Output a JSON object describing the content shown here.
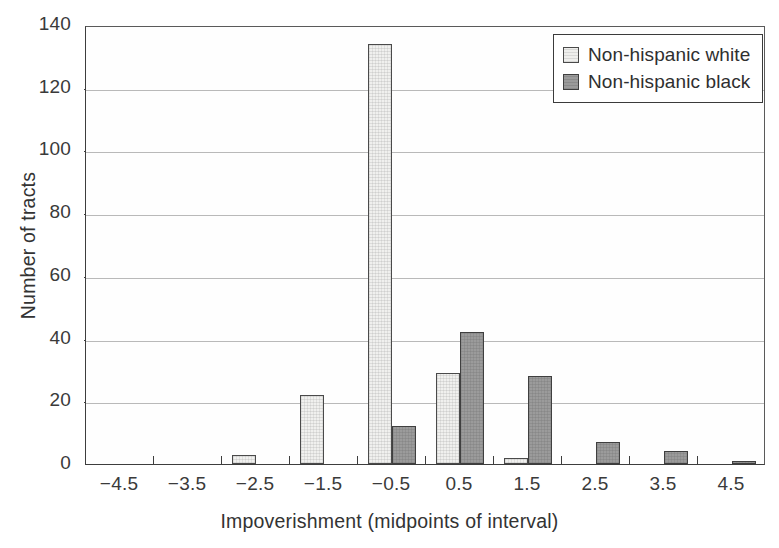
{
  "chart_data": {
    "type": "bar",
    "title": "",
    "subtitle": "",
    "xlabel": "Impoverishment (midpoints of interval)",
    "ylabel": "Number of tracts",
    "categories": [
      "-4.5",
      "-3.5",
      "-2.5",
      "-1.5",
      "-0.5",
      "0.5",
      "1.5",
      "2.5",
      "3.5",
      "4.5"
    ],
    "series": [
      {
        "name": "Non-hispanic white",
        "color": "#f0f0ee",
        "values": [
          0,
          0,
          3,
          22,
          134,
          29,
          2,
          0,
          0,
          0
        ]
      },
      {
        "name": "Non-hispanic black",
        "color": "#9b9b9b",
        "values": [
          0,
          0,
          0,
          0,
          12,
          42,
          28,
          7,
          4,
          1
        ]
      }
    ],
    "xlim": [
      -5,
      5
    ],
    "ylim": [
      0,
      140
    ],
    "ytick_values": [
      0,
      20,
      40,
      60,
      80,
      100,
      120,
      140
    ],
    "ytick_labels": [
      "0",
      "20",
      "40",
      "60",
      "80",
      "100",
      "120",
      "140"
    ],
    "grid": true,
    "grid_axis": "y",
    "legend_position": "top-right"
  },
  "legend": {
    "entries": [
      {
        "label": "Non-hispanic white",
        "swatch": "light-square-swatch"
      },
      {
        "label": "Non-hispanic black",
        "swatch": "gray-square-swatch"
      }
    ]
  }
}
